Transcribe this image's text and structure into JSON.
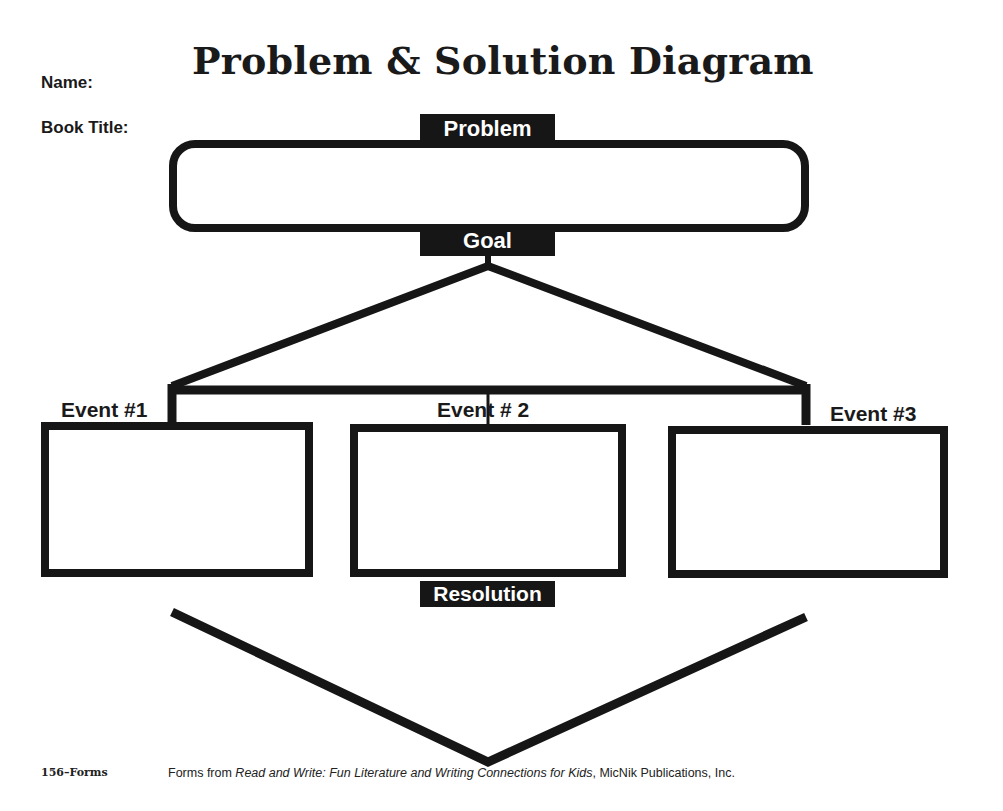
{
  "header": {
    "title": "Problem & Solution Diagram",
    "name_label": "Name:",
    "book_title_label": "Book Title:"
  },
  "diagram": {
    "problem_label": "Problem",
    "goal_label": "Goal",
    "events": [
      {
        "label": "Event #1"
      },
      {
        "label": "Event # 2"
      },
      {
        "label": "Event #3"
      }
    ],
    "resolution_label": "Resolution",
    "colors": {
      "ink": "#161616",
      "paper": "#ffffff"
    }
  },
  "footer": {
    "page": "156–Forms",
    "credit_prefix": "Forms from ",
    "credit_book": "Read and Write: Fun Literature and Writing Connections for Kids",
    "credit_suffix": ", MicNik Publications, Inc."
  }
}
